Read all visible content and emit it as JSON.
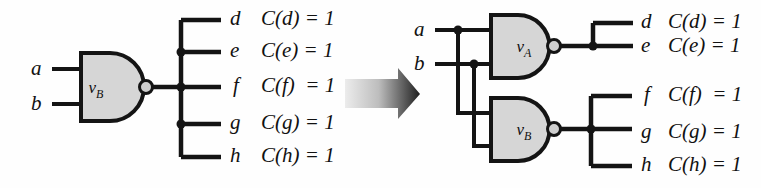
{
  "diagram": {
    "colors": {
      "wire": "#141414",
      "gate_fill": "#d6d6d6",
      "gate_stroke": "#141414",
      "bubble_fill": "#d0d0d0",
      "background": "#fefefe",
      "arrow_light": "#e8e8e8",
      "arrow_dark": "#2b2b2b"
    },
    "left_circuit": {
      "name": "before-transformation",
      "gate": {
        "label_main": "v",
        "label_sub": "B",
        "type": "nand"
      },
      "inputs": [
        {
          "name": "a",
          "label": "a"
        },
        {
          "name": "b",
          "label": "b"
        }
      ],
      "outputs": [
        {
          "name": "d",
          "label": "d",
          "cost": "C(d) = 1"
        },
        {
          "name": "e",
          "label": "e",
          "cost": "C(e) = 1"
        },
        {
          "name": "f",
          "label": "f",
          "cost": "C(f)  = 1"
        },
        {
          "name": "g",
          "label": "g",
          "cost": "C(g) = 1"
        },
        {
          "name": "h",
          "label": "h",
          "cost": "C(h) = 1"
        }
      ]
    },
    "arrow": {
      "name": "transformation-arrow",
      "direction": "right"
    },
    "right_circuit": {
      "name": "after-transformation",
      "gates": [
        {
          "label_main": "v",
          "label_sub": "A",
          "type": "nand"
        },
        {
          "label_main": "v",
          "label_sub": "B",
          "type": "nand"
        }
      ],
      "inputs": [
        {
          "name": "a",
          "label": "a"
        },
        {
          "name": "b",
          "label": "b"
        }
      ],
      "outputs_top": [
        {
          "name": "d",
          "label": "d",
          "cost": "C(d) = 1"
        },
        {
          "name": "e",
          "label": "e",
          "cost": "C(e) = 1"
        }
      ],
      "outputs_bottom": [
        {
          "name": "f",
          "label": "f",
          "cost": "C(f)  = 1"
        },
        {
          "name": "g",
          "label": "g",
          "cost": "C(g) = 1"
        },
        {
          "name": "h",
          "label": "h",
          "cost": "C(h) = 1"
        }
      ]
    }
  }
}
